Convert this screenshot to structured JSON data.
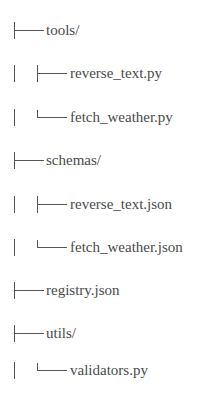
{
  "tree": {
    "entries": [
      {
        "name": "tools/",
        "depth": 0,
        "connector": "tee",
        "type": "folder"
      },
      {
        "name": "reverse_text.py",
        "depth": 1,
        "connector": "tee",
        "type": "file"
      },
      {
        "name": "fetch_weather.py",
        "depth": 1,
        "connector": "elbow",
        "type": "file"
      },
      {
        "name": "schemas/",
        "depth": 0,
        "connector": "tee",
        "type": "folder"
      },
      {
        "name": "reverse_text.json",
        "depth": 1,
        "connector": "tee",
        "type": "file"
      },
      {
        "name": "fetch_weather.json",
        "depth": 1,
        "connector": "elbow",
        "type": "file"
      },
      {
        "name": "registry.json",
        "depth": 0,
        "connector": "tee",
        "type": "file"
      },
      {
        "name": "utils/",
        "depth": 0,
        "connector": "tee",
        "type": "folder"
      },
      {
        "name": "validators.py",
        "depth": 1,
        "connector": "elbow",
        "type": "file"
      }
    ]
  }
}
